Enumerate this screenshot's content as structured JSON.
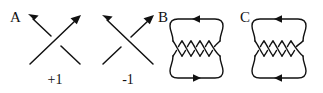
{
  "figure": {
    "background_color": "#ffffff",
    "ink_color": "#111111",
    "width": 323,
    "height": 93
  },
  "panels": [
    {
      "id": "panel-a",
      "label": "A",
      "label_x": 10,
      "label_y": 22,
      "type": "crossing",
      "sign_label": "+1",
      "sign_x": 55,
      "sign_y": 84,
      "over_strand": "bottom-left-to-top-right",
      "under_strand": "bottom-right-to-top-left",
      "arrow_directions": [
        "up-left",
        "up-right"
      ]
    },
    {
      "id": "panel-minus",
      "label": "",
      "type": "crossing",
      "sign_label": "-1",
      "sign_x": 128,
      "sign_y": 84,
      "over_strand": "bottom-right-to-top-left",
      "under_strand": "bottom-left-to-top-right",
      "arrow_directions": [
        "up-left",
        "up-right"
      ]
    },
    {
      "id": "panel-b",
      "label": "B",
      "label_x": 158,
      "label_y": 22,
      "type": "braid-closure",
      "crossing_count": 4,
      "top_arrow_direction": "left",
      "bottom_arrow_direction": "right"
    },
    {
      "id": "panel-c",
      "label": "C",
      "label_x": 240,
      "label_y": 22,
      "type": "braid-closure",
      "crossing_count": 4,
      "top_arrow_direction": "left",
      "bottom_arrow_direction": "left"
    }
  ]
}
